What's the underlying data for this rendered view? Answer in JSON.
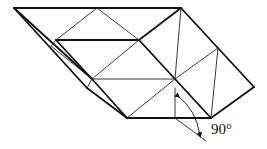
{
  "figure": {
    "type": "origami-fold-diagram",
    "annotation": {
      "angle_label": "90°",
      "arrow_type": "curved-double-arrow"
    },
    "colors": {
      "line": "#111111",
      "background": "#ffffff"
    }
  }
}
